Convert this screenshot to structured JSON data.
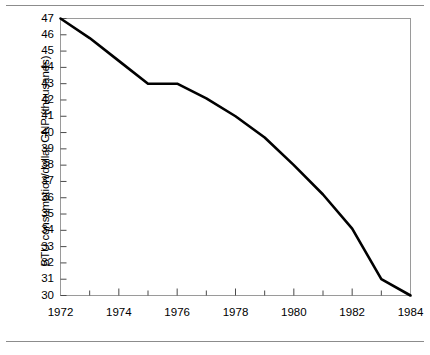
{
  "chart_data": {
    "type": "line",
    "title": "",
    "subtitle": "",
    "xlabel": "",
    "ylabel": "BTU consumption/dollar GNP (thousands)",
    "x": [
      1972,
      1973,
      1974,
      1975,
      1976,
      1977,
      1978,
      1979,
      1980,
      1981,
      1982,
      1983,
      1984
    ],
    "values": [
      47.0,
      45.8,
      44.4,
      43.0,
      43.0,
      42.1,
      41.0,
      39.7,
      38.0,
      36.2,
      34.1,
      31.0,
      30.0
    ],
    "series": [
      {
        "name": "BTU consumption/dollar GNP",
        "values": [
          47.0,
          45.8,
          44.4,
          43.0,
          43.0,
          42.1,
          41.0,
          39.7,
          38.0,
          36.2,
          34.1,
          31.0,
          30.0
        ]
      }
    ],
    "xlim": [
      1972,
      1984
    ],
    "ylim": [
      30,
      47
    ],
    "xticks": [
      1972,
      1974,
      1976,
      1978,
      1980,
      1982,
      1984
    ],
    "xtick_labels": [
      "1972",
      "1974",
      "1976",
      "1978",
      "1980",
      "1982",
      "1984"
    ],
    "xticks_minor": [
      1973,
      1975,
      1977,
      1979,
      1981,
      1983
    ],
    "yticks": [
      30,
      31,
      32,
      33,
      34,
      35,
      36,
      37,
      38,
      39,
      40,
      41,
      42,
      43,
      44,
      45,
      46,
      47
    ],
    "ytick_labels": [
      "30",
      "31",
      "32",
      "33",
      "34",
      "35",
      "36",
      "37",
      "38",
      "39",
      "40",
      "41",
      "42",
      "43",
      "44",
      "45",
      "46",
      "47"
    ],
    "grid": false,
    "legend": null,
    "legend_position": "none",
    "line_color": "#000000",
    "frame_color": "#9a9a9a",
    "background": "#ffffff",
    "annotations": []
  },
  "figure": {
    "rule_color": "#8c8c8c",
    "top_rule": true,
    "bottom_rule": true
  }
}
